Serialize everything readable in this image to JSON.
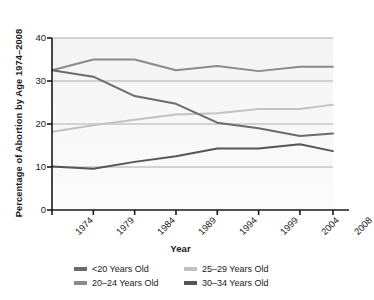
{
  "chart_data": {
    "type": "line",
    "title": "",
    "xlabel": "Year",
    "ylabel": "Percentage of Abortion by Age 1974–2008",
    "x": [
      1974,
      1979,
      1984,
      1989,
      1994,
      1999,
      2004,
      2008
    ],
    "categories": [
      "1974",
      "1979",
      "1984",
      "1989",
      "1994",
      "1999",
      "2004",
      "2008"
    ],
    "xlim": [
      1974,
      2008
    ],
    "ylim": [
      0,
      40
    ],
    "yticks": [
      0,
      10,
      20,
      30,
      40
    ],
    "ytick_labels": [
      "0",
      "10",
      "20",
      "30",
      "40"
    ],
    "grid": "horizontal",
    "legend_position": "bottom",
    "series": [
      {
        "name": "<20 Years Old",
        "color": "#6b6b6b",
        "values": [
          32.5,
          31.0,
          26.5,
          24.7,
          20.3,
          19.0,
          17.2,
          17.8
        ]
      },
      {
        "name": "20–24 Years Old",
        "color": "#8a8a8a",
        "values": [
          32.5,
          35.0,
          35.0,
          32.5,
          33.5,
          32.3,
          33.3,
          33.3
        ]
      },
      {
        "name": "25–29 Years Old",
        "color": "#c2c2c2",
        "values": [
          18.2,
          19.7,
          21.0,
          22.2,
          22.5,
          23.5,
          23.5,
          24.5
        ]
      },
      {
        "name": "30–34 Years Old",
        "color": "#555555",
        "values": [
          10.1,
          9.6,
          11.2,
          12.5,
          14.3,
          14.3,
          15.3,
          13.7
        ]
      }
    ]
  },
  "axes": {
    "y_title": "Percentage of Abortion by Age 1974–2008",
    "x_title": "Year",
    "y_tick_labels": [
      "40",
      "30",
      "20",
      "10",
      "0"
    ],
    "x_tick_labels": [
      "1974",
      "1979",
      "1984",
      "1989",
      "1994",
      "1999",
      "2004",
      "2008"
    ]
  },
  "legend": {
    "items": [
      {
        "label": "<20 Years Old",
        "color": "#6b6b6b"
      },
      {
        "label": "25–29 Years Old",
        "color": "#c2c2c2"
      },
      {
        "label": "20–24 Years Old",
        "color": "#8a8a8a"
      },
      {
        "label": "30–34 Years Old",
        "color": "#555555"
      }
    ]
  },
  "style": {
    "axis_color": "#1a1a1a",
    "grid_color": "#9a9a9a",
    "plot_background": "#f5f5f5",
    "page_background": "#ffffff"
  }
}
